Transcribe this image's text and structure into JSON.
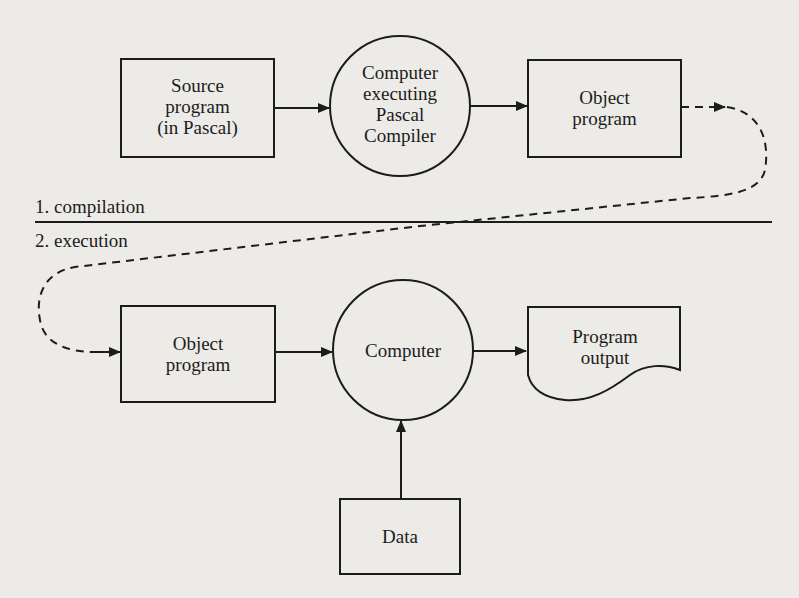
{
  "phases": {
    "compilation_label": "1. compilation",
    "execution_label": "2. execution"
  },
  "compilation": {
    "source_box": "Source\nprogram\n(in Pascal)",
    "compiler_node": "Computer\nexecuting\nPascal\nCompiler",
    "object_box": "Object\nprogram"
  },
  "execution": {
    "object_box": "Object\nprogram",
    "computer_node": "Computer",
    "output_doc": "Program\noutput",
    "data_box": "Data"
  },
  "colors": {
    "background": "#ecebe7",
    "ink": "#1c1c1c"
  }
}
